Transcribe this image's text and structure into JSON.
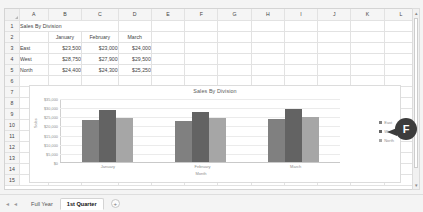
{
  "spreadsheet": {
    "column_headers": [
      "A",
      "B",
      "C",
      "D",
      "E",
      "F",
      "G",
      "H",
      "I",
      "J",
      "K",
      "L"
    ],
    "row_headers": [
      "1",
      "2",
      "3",
      "4",
      "5",
      "6",
      "7",
      "8",
      "9",
      "10",
      "11",
      "12",
      "13",
      "14",
      "15"
    ],
    "title_cell": "Sales By Division",
    "table": {
      "corner_blank": "",
      "columns": [
        "January",
        "February",
        "March"
      ],
      "rows": [
        {
          "label": "East",
          "values": [
            "$23,500",
            "$23,000",
            "$24,000"
          ]
        },
        {
          "label": "West",
          "values": [
            "$28,750",
            "$27,900",
            "$29,500"
          ]
        },
        {
          "label": "North",
          "values": [
            "$24,400",
            "$24,300",
            "$25,250"
          ]
        }
      ]
    }
  },
  "chart_data": {
    "type": "bar",
    "title": "Sales By Division",
    "categories": [
      "January",
      "February",
      "March"
    ],
    "series": [
      {
        "name": "East",
        "values": [
          23500,
          23000,
          24000
        ],
        "color": "#808080"
      },
      {
        "name": "West",
        "values": [
          28750,
          27900,
          29500
        ],
        "color": "#636363"
      },
      {
        "name": "North",
        "values": [
          24400,
          24300,
          25250
        ],
        "color": "#a6a6a6"
      }
    ],
    "xlabel": "Month",
    "ylabel": "Sales",
    "ylim": [
      0,
      35000
    ],
    "yticks": [
      "$35,000",
      "$30,000",
      "$25,000",
      "$20,000",
      "$15,000",
      "$10,000",
      "$5,000",
      "$0"
    ],
    "grid": true,
    "legend_position": "right"
  },
  "tabs": {
    "nav_first": "◂",
    "nav_prev": "◂",
    "sheets": [
      {
        "label": "Full Year",
        "active": false
      },
      {
        "label": "1st Quarter",
        "active": true
      }
    ],
    "add_label": "+"
  },
  "scroll": {
    "up_arrow": "▴",
    "down_arrow": "▾",
    "left_arrow": "◂",
    "right_arrow": "▸"
  },
  "callout": {
    "letter": "F"
  }
}
